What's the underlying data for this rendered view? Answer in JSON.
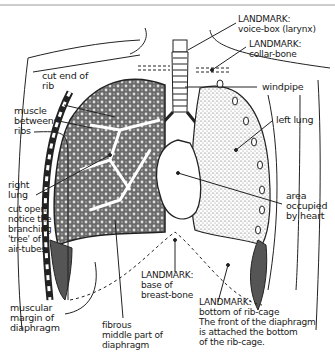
{
  "diagram": {
    "labels": {
      "voice_box": "LANDMARK:\nvoice-box (larynx)",
      "collar_bone": "LANDMARK:\ncollar-bone",
      "windpipe": "windpipe",
      "left_lung": "left lung",
      "heart_area": "area\noccupied\nby heart",
      "cut_end_rib": "cut end of\nrib",
      "muscle_between_ribs": "muscle\nbetween\nribs",
      "right_lung": "right\nlung",
      "cut_open_note": "cut open:\nnotice the\nbranching\n'tree' of\nair-tubes",
      "base_breast_bone": "LANDMARK:\nbase of\nbreast-bone",
      "muscular_margin": "muscular\nmargin of\ndiaphragm",
      "fibrous_middle": "fibrous\nmiddle part of\ndiaphragm",
      "bottom_rib_cage": "LANDMARK:\nbottom of rib-cage\nThe front of the diaphragm\nis attached the bottom\nof the rib-cage."
    },
    "colors": {
      "ink": "#1a1a1a",
      "stipple": "#8a8a8a",
      "frame": "#9a9a9a"
    }
  }
}
